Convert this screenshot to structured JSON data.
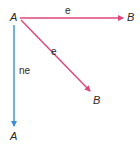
{
  "diagram": {
    "colors": {
      "pink": "#e0457a",
      "blue": "#3a8fd6",
      "text": "#2a2a2a"
    },
    "arrows": [
      {
        "id": "horizontal",
        "from": "A",
        "to": "B",
        "label": "e",
        "color": "pink"
      },
      {
        "id": "diagonal",
        "from": "A",
        "to": "B",
        "label": "e",
        "color": "pink"
      },
      {
        "id": "vertical",
        "from": "A",
        "to": "A",
        "label": "ne",
        "color": "blue"
      }
    ],
    "labels": {
      "origin": "A",
      "horizontal_end": "B",
      "horizontal_edge": "e",
      "diagonal_end": "B",
      "diagonal_edge": "e",
      "vertical_end": "A",
      "vertical_edge": "ne"
    }
  }
}
